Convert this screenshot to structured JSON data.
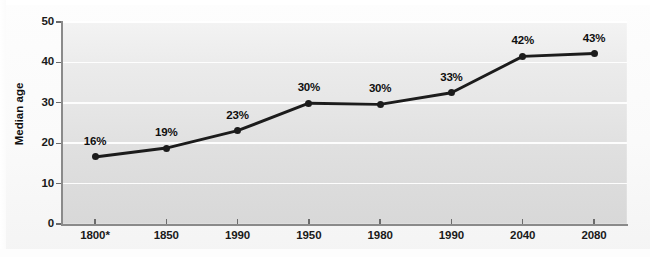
{
  "chart_data": {
    "type": "line",
    "title": "",
    "subtitle": "",
    "xlabel": "",
    "ylabel": "Median age",
    "ylim": [
      0,
      50
    ],
    "yticks": [
      0,
      10,
      20,
      30,
      40,
      50
    ],
    "ytick_labels": [
      "0",
      "10",
      "20",
      "30",
      "40",
      "50"
    ],
    "grid": true,
    "grid_orientation": "horizontal",
    "legend": false,
    "legend_position": "none",
    "categories": [
      "1800*",
      "1850",
      "1990",
      "1950",
      "1980",
      "1990",
      "2040",
      "2080"
    ],
    "values": [
      16.6,
      18.8,
      23.1,
      29.9,
      29.6,
      32.5,
      41.5,
      42.2
    ],
    "point_labels": [
      "16%",
      "19%",
      "23%",
      "30%",
      "30%",
      "33%",
      "42%",
      "43%"
    ],
    "series": [
      {
        "name": "Median age",
        "values": [
          16.6,
          18.8,
          23.1,
          29.9,
          29.6,
          32.5,
          41.5,
          42.2
        ],
        "labels": [
          "16%",
          "19%",
          "23%",
          "30%",
          "30%",
          "33%",
          "42%",
          "43%"
        ],
        "color": "#1c1c1c",
        "marker": "circle"
      }
    ],
    "colors": {
      "line": "#1c1c1c",
      "marker": "#1c1c1c",
      "gridline": "#ffffff",
      "axis": "#8a8a8a",
      "plot_background_top": "#f3f3f3",
      "plot_background_bottom": "#d8d8d8",
      "figure_background": "#fbfbfb",
      "text": "#1a1a1a"
    }
  },
  "axes": {
    "y_title": "Median age"
  }
}
